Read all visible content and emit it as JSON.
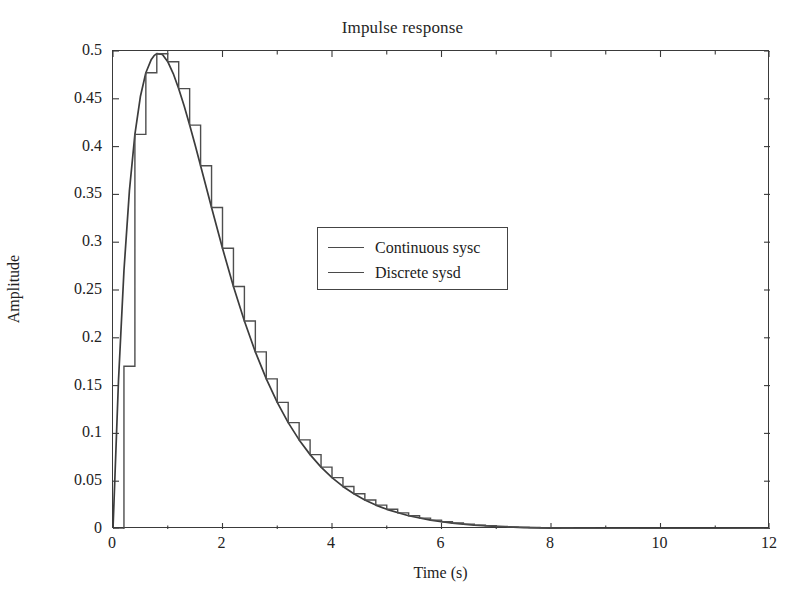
{
  "chart_data": {
    "type": "line",
    "title": "Impulse response",
    "xlabel": "Time (s)",
    "ylabel": "Amplitude",
    "xlim": [
      0,
      12
    ],
    "ylim": [
      0,
      0.5
    ],
    "xticks": [
      0,
      2,
      4,
      6,
      8,
      10,
      12
    ],
    "yticks": [
      0,
      0.05,
      0.1,
      0.15,
      0.2,
      0.25,
      0.3,
      0.35,
      0.4,
      0.45,
      0.5
    ],
    "xtick_labels": [
      "0",
      "2",
      "4",
      "6",
      "8",
      "10",
      "12"
    ],
    "ytick_labels": [
      "0",
      "0.05",
      "0.1",
      "0.15",
      "0.2",
      "0.25",
      "0.3",
      "0.35",
      "0.4",
      "0.45",
      "0.5"
    ],
    "grid": false,
    "legend_position": "upper center",
    "sample_time": 0.2,
    "series": [
      {
        "name": "Continuous sysc",
        "style": "solid",
        "color": "#3c3c3c",
        "x": [
          0,
          0.1,
          0.2,
          0.3,
          0.4,
          0.5,
          0.6,
          0.7,
          0.75,
          0.8,
          0.9,
          1.0,
          1.1,
          1.2,
          1.3,
          1.4,
          1.5,
          1.6,
          1.8,
          2.0,
          2.2,
          2.4,
          2.6,
          2.8,
          3.0,
          3.2,
          3.4,
          3.6,
          3.8,
          4.0,
          4.2,
          4.4,
          4.6,
          4.8,
          5.0,
          5.4,
          5.8,
          6.2,
          6.6,
          7.0,
          7.5,
          8.0,
          8.5,
          9.0,
          9.5,
          10.0,
          11.0,
          12.0
        ],
        "y": [
          0,
          0.1549,
          0.2702,
          0.354,
          0.4128,
          0.4524,
          0.4773,
          0.4912,
          0.4951,
          0.4972,
          0.4965,
          0.4888,
          0.4764,
          0.4606,
          0.4424,
          0.4225,
          0.4016,
          0.38,
          0.3363,
          0.2936,
          0.2537,
          0.2175,
          0.1853,
          0.157,
          0.1325,
          0.1113,
          0.0932,
          0.0778,
          0.0647,
          0.0537,
          0.0445,
          0.0368,
          0.0303,
          0.025,
          0.0206,
          0.0139,
          0.0093,
          0.0062,
          0.0041,
          0.0027,
          0.0015,
          0.0009,
          0.0005,
          0.0003,
          0.0002,
          0.0001,
          3e-05,
          1e-05
        ]
      },
      {
        "name": "Discrete sysd",
        "style": "staircase",
        "color": "#4a4a4a",
        "x": [
          0,
          0.2,
          0.4,
          0.6,
          0.8,
          1.0,
          1.2,
          1.4,
          1.6,
          1.8,
          2.0,
          2.2,
          2.4,
          2.6,
          2.8,
          3.0,
          3.2,
          3.4,
          3.6,
          3.8,
          4.0,
          4.2,
          4.4,
          4.6,
          4.8,
          5.0,
          5.2,
          5.4,
          5.6,
          5.8,
          6.0,
          6.2,
          6.4,
          6.6,
          6.8,
          7.0,
          7.2,
          7.4,
          7.6,
          7.8,
          8.0,
          8.2,
          8.4,
          8.6,
          8.8,
          9.0,
          9.2,
          9.4,
          9.6,
          9.8,
          10.0,
          10.2,
          10.4,
          10.6,
          10.8,
          11.0,
          11.2,
          11.4,
          11.6,
          11.8,
          12.0
        ],
        "y": [
          0,
          0.1702,
          0.4128,
          0.4773,
          0.4972,
          0.4888,
          0.4606,
          0.4225,
          0.38,
          0.3363,
          0.2936,
          0.2537,
          0.2175,
          0.1853,
          0.157,
          0.1325,
          0.1113,
          0.0932,
          0.0778,
          0.0647,
          0.0537,
          0.0445,
          0.0368,
          0.0303,
          0.025,
          0.0206,
          0.0169,
          0.0139,
          0.0114,
          0.0093,
          0.0076,
          0.0062,
          0.0051,
          0.0041,
          0.0034,
          0.0027,
          0.0022,
          0.0018,
          0.0015,
          0.0012,
          0.0009,
          0.0008,
          0.0006,
          0.0005,
          0.0004,
          0.0003,
          0.00027,
          0.00022,
          0.00018,
          0.00014,
          0.00011,
          9e-05,
          8e-05,
          6e-05,
          5e-05,
          4e-05,
          3e-05,
          3e-05,
          2e-05,
          2e-05,
          1e-05
        ]
      }
    ]
  },
  "legend": {
    "entries": [
      {
        "label": "Continuous sysc"
      },
      {
        "label": "Discrete sysd"
      }
    ]
  }
}
